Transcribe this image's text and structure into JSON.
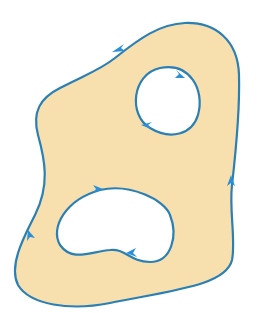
{
  "diagram": {
    "colors": {
      "region_fill": "#f8dfae",
      "curve": "#2a7fb4",
      "arrow": "#2a8fd8",
      "background": "#ffffff"
    },
    "outer_boundary": {
      "orientation": "counterclockwise",
      "arrow_count": 3
    },
    "holes": [
      {
        "name": "upper-right-hole",
        "orientation": "clockwise",
        "arrow_count": 2
      },
      {
        "name": "lower-left-hole",
        "orientation": "clockwise",
        "arrow_count": 2
      }
    ]
  }
}
